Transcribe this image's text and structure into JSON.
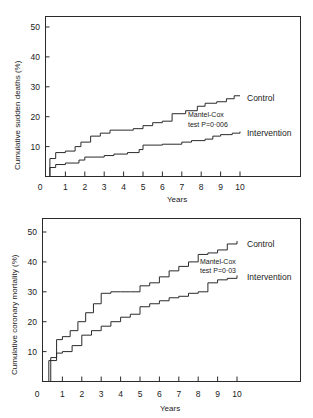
{
  "chart_data": [
    {
      "type": "line",
      "subtype": "step (Kaplan-Meier cumulative incidence)",
      "title": "",
      "xlabel": "Years",
      "ylabel": "Cumulative sudden deaths (%)",
      "xlim": [
        0,
        10
      ],
      "ylim": [
        0,
        50
      ],
      "xticks": [
        "0",
        "1",
        "2",
        "3",
        "4",
        "5",
        "6",
        "7",
        "8",
        "9",
        "10"
      ],
      "yticks": [
        "10",
        "20",
        "30",
        "40",
        "50"
      ],
      "grid": false,
      "annotation": {
        "line1": "Mantel-Cox",
        "line2": "test P=0·006"
      },
      "series": [
        {
          "name": "Control",
          "x": [
            0,
            0.2,
            0.5,
            1.0,
            1.5,
            1.8,
            2.3,
            2.8,
            3.3,
            4.5,
            5.0,
            5.5,
            6.0,
            6.5,
            7.2,
            7.8,
            8.2,
            8.8,
            9.3,
            9.7,
            10.0
          ],
          "values": [
            0,
            6,
            8,
            8.5,
            10,
            11.5,
            13.5,
            14.5,
            15.5,
            16,
            17,
            18,
            18.5,
            21,
            22,
            23.5,
            24.5,
            25,
            26,
            27,
            27
          ]
        },
        {
          "name": "Intervention",
          "x": [
            0,
            0.2,
            0.5,
            1.0,
            1.7,
            2.0,
            3.0,
            3.5,
            4.2,
            4.8,
            5.0,
            6.0,
            7.0,
            7.5,
            8.2,
            8.6,
            9.0,
            9.6,
            10.0
          ],
          "values": [
            0,
            3,
            4,
            4.5,
            5.5,
            6.5,
            7,
            7.5,
            8,
            9,
            10.5,
            10.8,
            11.5,
            12,
            12.5,
            13.5,
            14,
            14.5,
            15
          ]
        }
      ]
    },
    {
      "type": "line",
      "subtype": "step (Kaplan-Meier cumulative incidence)",
      "title": "",
      "xlabel": "Years",
      "ylabel": "Cumulative coronary mortality (%)",
      "xlim": [
        0,
        10
      ],
      "ylim": [
        0,
        50
      ],
      "xticks": [
        "0",
        "1",
        "2",
        "3",
        "4",
        "5",
        "6",
        "7",
        "8",
        "9",
        "10"
      ],
      "yticks": [
        "10",
        "20",
        "30",
        "40",
        "50"
      ],
      "grid": false,
      "annotation": {
        "line1": "Mantel-Cox",
        "line2": "test P=0·03"
      },
      "series": [
        {
          "name": "Control",
          "x": [
            0,
            0.4,
            0.7,
            1.0,
            1.4,
            1.8,
            2.2,
            2.6,
            3.0,
            3.5,
            4.0,
            4.5,
            5.0,
            5.5,
            6.0,
            6.5,
            7.0,
            7.5,
            8.0,
            8.5,
            9.0,
            9.5,
            10.0
          ],
          "values": [
            0,
            8,
            14,
            15,
            17,
            20,
            23,
            26,
            29.5,
            30,
            30,
            30,
            32,
            33,
            35,
            37,
            38.5,
            40,
            42.5,
            43,
            44,
            46,
            47
          ]
        },
        {
          "name": "Intervention",
          "x": [
            0,
            0.3,
            0.7,
            1.0,
            1.5,
            2.0,
            2.5,
            3.0,
            3.5,
            4.0,
            4.5,
            5.0,
            5.5,
            6.0,
            6.5,
            7.0,
            7.5,
            8.0,
            8.5,
            9.0,
            9.5,
            10.0
          ],
          "values": [
            0,
            7,
            9.5,
            10,
            12,
            15.5,
            17,
            18.5,
            20,
            21.5,
            22.5,
            25,
            26,
            27,
            28,
            28.5,
            29.5,
            30,
            33,
            34,
            34.5,
            35.5
          ]
        }
      ]
    }
  ]
}
